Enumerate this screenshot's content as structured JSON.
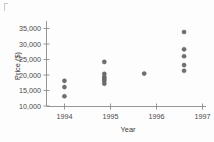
{
  "chart_data": {
    "type": "scatter",
    "title": "",
    "xlabel": "Year",
    "ylabel": "Price ($)",
    "xlim": [
      1993.55,
      1997.55
    ],
    "ylim": [
      9000,
      36000
    ],
    "grid": false,
    "legend": null,
    "x_ticks": [
      1994,
      1995,
      1996,
      1997
    ],
    "x_tick_labels": [
      "1994",
      "1995",
      "1996",
      "1997"
    ],
    "y_ticks": [
      10000,
      15000,
      20000,
      25000,
      30000,
      35000
    ],
    "y_tick_labels": [
      "10,000",
      "15,000",
      "20,000",
      "25,000",
      "30,000",
      "35,000"
    ],
    "points": [
      {
        "x": 1994,
        "y": 17000
      },
      {
        "x": 1994,
        "y": 15000
      },
      {
        "x": 1994,
        "y": 12100
      },
      {
        "x": 1995,
        "y": 23000
      },
      {
        "x": 1995,
        "y": 19200
      },
      {
        "x": 1995,
        "y": 18200
      },
      {
        "x": 1995,
        "y": 17600
      },
      {
        "x": 1995,
        "y": 17000
      },
      {
        "x": 1995,
        "y": 16100
      },
      {
        "x": 1996,
        "y": 19300
      },
      {
        "x": 1997,
        "y": 32500
      },
      {
        "x": 1997,
        "y": 27000
      },
      {
        "x": 1997,
        "y": 24800
      },
      {
        "x": 1997,
        "y": 22000
      },
      {
        "x": 1997,
        "y": 20200
      }
    ],
    "marker": {
      "shape": "circle",
      "size": 2.1,
      "fill_color": "#6f6f6f",
      "edge_color": "#4a4a4a"
    },
    "colors": {
      "background": "#fdfdfd",
      "axis": "#8a8a8a",
      "text": "#4a4a4a"
    }
  }
}
